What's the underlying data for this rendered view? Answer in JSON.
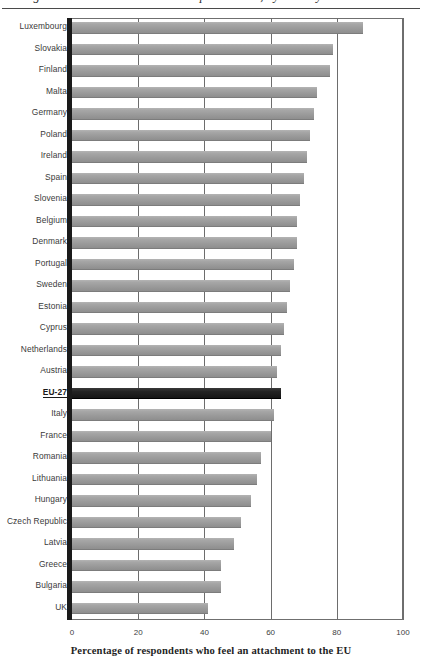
{
  "figure": {
    "clipped_running_title": "Figure 3.4 Attachment to the European Union, by country",
    "x_axis_title": "Percentage of respondents who feel an attachment to the EU"
  },
  "axis": {
    "ticks": [
      0,
      20,
      40,
      60,
      80,
      100
    ],
    "min": 0,
    "max": 100
  },
  "chart_data": {
    "type": "bar",
    "orientation": "horizontal",
    "title": "Attachment to the European Union, by country",
    "xlabel": "Percentage of respondents who feel an attachment to the EU",
    "ylabel": "",
    "xlim": [
      0,
      100
    ],
    "xticks": [
      0,
      20,
      40,
      60,
      80,
      100
    ],
    "grid": "vertical",
    "legend": "none",
    "highlight_category": "EU-27",
    "bar_color": "#9e9e9e",
    "highlight_color": "#1a1a1a",
    "categories": [
      "Luxembourg",
      "Slovakia",
      "Finland",
      "Malta",
      "Germany",
      "Poland",
      "Ireland",
      "Spain",
      "Slovenia",
      "Belgium",
      "Denmark",
      "Portugal",
      "Sweden",
      "Estonia",
      "Cyprus",
      "Netherlands",
      "Austria",
      "EU-27",
      "Italy",
      "France",
      "Romania",
      "Lithuania",
      "Hungary",
      "Czech Republic",
      "Latvia",
      "Greece",
      "Bulgaria",
      "UK"
    ],
    "values": [
      88,
      79,
      78,
      74,
      73,
      72,
      71,
      70,
      69,
      68,
      68,
      67,
      66,
      65,
      64,
      63,
      62,
      63,
      61,
      60,
      57,
      56,
      54,
      51,
      49,
      45,
      45,
      41
    ]
  }
}
